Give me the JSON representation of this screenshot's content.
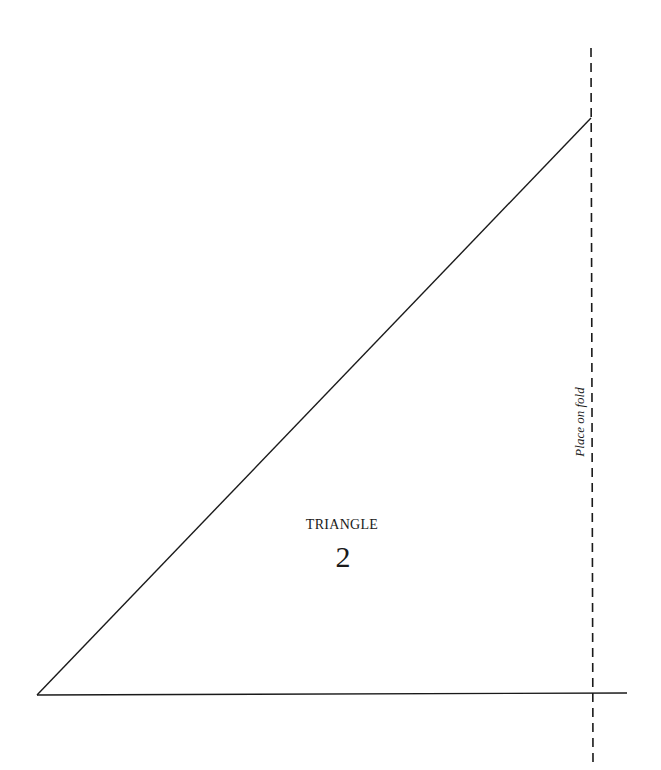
{
  "pattern": {
    "piece_name": "TRIANGLE",
    "piece_number": "2",
    "fold_label": "Place on fold",
    "colors": {
      "line": "#1a1a1a",
      "background": "#ffffff"
    },
    "geometry": {
      "apex": [
        591,
        118
      ],
      "bottom_left": [
        37,
        695
      ],
      "baseline_end": [
        627,
        694
      ],
      "fold_line_x": 591,
      "fold_line_top": 48,
      "fold_line_bottom": 762
    }
  }
}
